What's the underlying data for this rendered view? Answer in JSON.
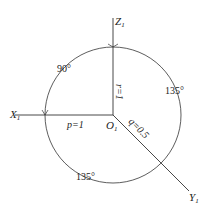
{
  "diagram": {
    "axes": {
      "x": {
        "label": "X",
        "subscript": "1"
      },
      "y": {
        "label": "Y",
        "subscript": "1"
      },
      "z": {
        "label": "Z",
        "subscript": "1"
      }
    },
    "origin": {
      "label": "O",
      "subscript": "1"
    },
    "coefficients": {
      "p": "p=1",
      "q": "q=0.5",
      "r": "r=1"
    },
    "angles": {
      "upper_left": "90°",
      "right": "135°",
      "lower": "135°"
    },
    "colors": {
      "line": "#333333",
      "background": "#ffffff"
    }
  }
}
